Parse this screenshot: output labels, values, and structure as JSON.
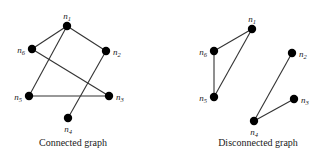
{
  "background": "#ffffff",
  "colors": {
    "node": "#000000",
    "edge": "#333333",
    "label": "#1a1a1a"
  },
  "node_radius": 4.2,
  "edge_width": 1.1,
  "graphs": [
    {
      "name": "connected-graph",
      "caption": "Connected graph",
      "nodes": [
        {
          "id": "n1",
          "label": "n",
          "sub": "1",
          "x": 67,
          "y": 26,
          "label_pos": "top"
        },
        {
          "id": "n2",
          "label": "n",
          "sub": "2",
          "x": 106,
          "y": 51,
          "label_pos": "right"
        },
        {
          "id": "n3",
          "label": "n",
          "sub": "3",
          "x": 109,
          "y": 96,
          "label_pos": "right"
        },
        {
          "id": "n4",
          "label": "n",
          "sub": "4",
          "x": 68,
          "y": 118,
          "label_pos": "bottom"
        },
        {
          "id": "n5",
          "label": "n",
          "sub": "5",
          "x": 29,
          "y": 96,
          "label_pos": "left"
        },
        {
          "id": "n6",
          "label": "n",
          "sub": "6",
          "x": 32,
          "y": 49,
          "label_pos": "left"
        }
      ],
      "edges": [
        [
          "n1",
          "n6"
        ],
        [
          "n1",
          "n2"
        ],
        [
          "n1",
          "n5"
        ],
        [
          "n6",
          "n3"
        ],
        [
          "n5",
          "n3"
        ],
        [
          "n2",
          "n4"
        ]
      ]
    },
    {
      "name": "disconnected-graph",
      "caption": "Disconnected graph",
      "nodes": [
        {
          "id": "n1",
          "label": "n",
          "sub": "1",
          "x": 252,
          "y": 29,
          "label_pos": "top"
        },
        {
          "id": "n2",
          "label": "n",
          "sub": "2",
          "x": 292,
          "y": 53,
          "label_pos": "right"
        },
        {
          "id": "n3",
          "label": "n",
          "sub": "3",
          "x": 294,
          "y": 99,
          "label_pos": "right"
        },
        {
          "id": "n4",
          "label": "n",
          "sub": "4",
          "x": 254,
          "y": 121,
          "label_pos": "bottom"
        },
        {
          "id": "n5",
          "label": "n",
          "sub": "5",
          "x": 214,
          "y": 97,
          "label_pos": "left"
        },
        {
          "id": "n6",
          "label": "n",
          "sub": "6",
          "x": 214,
          "y": 51,
          "label_pos": "left"
        }
      ],
      "edges": [
        [
          "n1",
          "n6"
        ],
        [
          "n6",
          "n5"
        ],
        [
          "n5",
          "n1"
        ],
        [
          "n4",
          "n2"
        ],
        [
          "n4",
          "n3"
        ]
      ]
    }
  ]
}
